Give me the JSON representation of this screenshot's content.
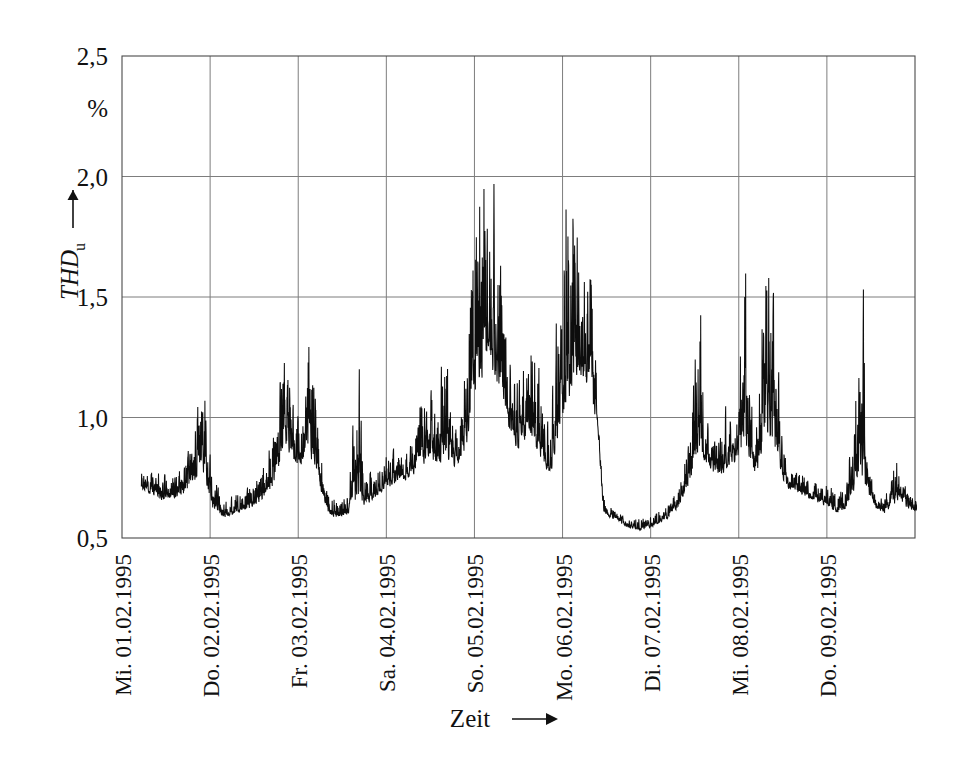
{
  "figure": {
    "background_color": "#ffffff",
    "ink_color": "#111111",
    "grid_color": "#7d7d7d"
  },
  "chart_data": {
    "type": "line",
    "title": "",
    "subtitle": "",
    "xlabel": "Zeit",
    "xlabel_arrow": "→",
    "ylabel": "THD",
    "ylabel_subscript": "u",
    "ylabel_arrow": "→",
    "yunit": "%",
    "ylim": [
      0.5,
      2.5
    ],
    "xlim": [
      0,
      9
    ],
    "grid": true,
    "legend": "none",
    "y_ticks": [
      0.5,
      1.0,
      1.5,
      2.0,
      2.5
    ],
    "y_tick_labels": [
      "0,5",
      "1,0",
      "1,5",
      "2,0",
      "2,5"
    ],
    "x_tick_positions": [
      0,
      1,
      2,
      3,
      4,
      5,
      6,
      7,
      8
    ],
    "x_tick_labels": [
      "Mi. 01.02.1995",
      "Do. 02.02.1995",
      "Fr. 03.02.1995",
      "Sa. 04.02.1995",
      "So. 05.02.1995",
      "Mo. 06.02.1995",
      "Di. 07.02.1995",
      "Mi. 08.02.1995",
      "Do. 09.02.1995"
    ],
    "x_tick_rotation_deg": -90,
    "series_name": "THD_u",
    "sampling_note": "10-minute aggregated values over 8 days",
    "data_start_x": 0.22,
    "data_end_x": 8.07,
    "observed_min": 0.53,
    "observed_max": 2.53,
    "envelope_keypoints": [
      {
        "x": 0.22,
        "base": 0.7,
        "peak": 0.8
      },
      {
        "x": 0.33,
        "base": 0.68,
        "peak": 0.82
      },
      {
        "x": 0.45,
        "base": 0.65,
        "peak": 0.79
      },
      {
        "x": 0.58,
        "base": 0.66,
        "peak": 0.8
      },
      {
        "x": 0.7,
        "base": 0.67,
        "peak": 0.83
      },
      {
        "x": 0.8,
        "base": 0.7,
        "peak": 0.95
      },
      {
        "x": 0.88,
        "base": 0.75,
        "peak": 1.27
      },
      {
        "x": 0.94,
        "base": 0.72,
        "peak": 1.24
      },
      {
        "x": 1.02,
        "base": 0.62,
        "peak": 0.8
      },
      {
        "x": 1.15,
        "base": 0.58,
        "peak": 0.68
      },
      {
        "x": 1.3,
        "base": 0.6,
        "peak": 0.7
      },
      {
        "x": 1.45,
        "base": 0.62,
        "peak": 0.74
      },
      {
        "x": 1.58,
        "base": 0.64,
        "peak": 0.8
      },
      {
        "x": 1.7,
        "base": 0.7,
        "peak": 0.98
      },
      {
        "x": 1.8,
        "base": 0.8,
        "peak": 1.3
      },
      {
        "x": 1.86,
        "base": 0.85,
        "peak": 1.66
      },
      {
        "x": 1.92,
        "base": 0.82,
        "peak": 1.2
      },
      {
        "x": 1.98,
        "base": 0.78,
        "peak": 1.0
      },
      {
        "x": 2.04,
        "base": 0.8,
        "peak": 1.1
      },
      {
        "x": 2.1,
        "base": 0.85,
        "peak": 1.55
      },
      {
        "x": 2.16,
        "base": 0.8,
        "peak": 1.47
      },
      {
        "x": 2.24,
        "base": 0.7,
        "peak": 0.95
      },
      {
        "x": 2.34,
        "base": 0.6,
        "peak": 0.72
      },
      {
        "x": 2.46,
        "base": 0.57,
        "peak": 0.66
      },
      {
        "x": 2.58,
        "base": 0.6,
        "peak": 0.7
      },
      {
        "x": 2.66,
        "base": 0.62,
        "peak": 1.63
      },
      {
        "x": 2.74,
        "base": 0.63,
        "peak": 0.8
      },
      {
        "x": 2.88,
        "base": 0.66,
        "peak": 0.82
      },
      {
        "x": 3.0,
        "base": 0.7,
        "peak": 0.88
      },
      {
        "x": 3.12,
        "base": 0.72,
        "peak": 0.92
      },
      {
        "x": 3.24,
        "base": 0.74,
        "peak": 0.9
      },
      {
        "x": 3.34,
        "base": 0.76,
        "peak": 1.02
      },
      {
        "x": 3.42,
        "base": 0.8,
        "peak": 1.28
      },
      {
        "x": 3.5,
        "base": 0.82,
        "peak": 1.24
      },
      {
        "x": 3.58,
        "base": 0.78,
        "peak": 1.0
      },
      {
        "x": 3.66,
        "base": 0.8,
        "peak": 1.57
      },
      {
        "x": 3.74,
        "base": 0.78,
        "peak": 1.05
      },
      {
        "x": 3.82,
        "base": 0.8,
        "peak": 1.02
      },
      {
        "x": 3.9,
        "base": 0.85,
        "peak": 1.35
      },
      {
        "x": 3.98,
        "base": 1.0,
        "peak": 1.9
      },
      {
        "x": 4.04,
        "base": 1.1,
        "peak": 2.53
      },
      {
        "x": 4.1,
        "base": 1.15,
        "peak": 2.22
      },
      {
        "x": 4.16,
        "base": 1.2,
        "peak": 1.85
      },
      {
        "x": 4.22,
        "base": 1.15,
        "peak": 2.08
      },
      {
        "x": 4.3,
        "base": 1.05,
        "peak": 1.8
      },
      {
        "x": 4.38,
        "base": 0.95,
        "peak": 1.45
      },
      {
        "x": 4.46,
        "base": 0.85,
        "peak": 1.22
      },
      {
        "x": 4.54,
        "base": 0.88,
        "peak": 1.28
      },
      {
        "x": 4.62,
        "base": 0.9,
        "peak": 1.48
      },
      {
        "x": 4.7,
        "base": 0.85,
        "peak": 1.38
      },
      {
        "x": 4.78,
        "base": 0.8,
        "peak": 1.1
      },
      {
        "x": 4.86,
        "base": 0.75,
        "peak": 1.05
      },
      {
        "x": 4.92,
        "base": 0.8,
        "peak": 1.45
      },
      {
        "x": 4.98,
        "base": 0.95,
        "peak": 1.62
      },
      {
        "x": 5.04,
        "base": 1.0,
        "peak": 2.49
      },
      {
        "x": 5.1,
        "base": 1.05,
        "peak": 2.22
      },
      {
        "x": 5.16,
        "base": 1.1,
        "peak": 1.9
      },
      {
        "x": 5.22,
        "base": 1.15,
        "peak": 1.88
      },
      {
        "x": 5.28,
        "base": 1.1,
        "peak": 1.78
      },
      {
        "x": 5.34,
        "base": 1.0,
        "peak": 1.8
      },
      {
        "x": 5.4,
        "base": 0.95,
        "peak": 1.02
      },
      {
        "x": 5.46,
        "base": 0.6,
        "peak": 0.7
      },
      {
        "x": 5.6,
        "base": 0.57,
        "peak": 0.62
      },
      {
        "x": 5.75,
        "base": 0.54,
        "peak": 0.6
      },
      {
        "x": 5.9,
        "base": 0.53,
        "peak": 0.6
      },
      {
        "x": 6.05,
        "base": 0.55,
        "peak": 0.62
      },
      {
        "x": 6.2,
        "base": 0.58,
        "peak": 0.66
      },
      {
        "x": 6.32,
        "base": 0.62,
        "peak": 0.74
      },
      {
        "x": 6.42,
        "base": 0.7,
        "peak": 0.95
      },
      {
        "x": 6.5,
        "base": 0.78,
        "peak": 1.3
      },
      {
        "x": 6.56,
        "base": 0.82,
        "peak": 1.75
      },
      {
        "x": 6.62,
        "base": 0.8,
        "peak": 1.05
      },
      {
        "x": 6.7,
        "base": 0.76,
        "peak": 0.92
      },
      {
        "x": 6.8,
        "base": 0.74,
        "peak": 0.98
      },
      {
        "x": 6.88,
        "base": 0.78,
        "peak": 1.12
      },
      {
        "x": 6.94,
        "base": 0.8,
        "peak": 1.05
      },
      {
        "x": 7.0,
        "base": 0.82,
        "peak": 1.15
      },
      {
        "x": 7.06,
        "base": 0.85,
        "peak": 1.97
      },
      {
        "x": 7.12,
        "base": 0.8,
        "peak": 1.3
      },
      {
        "x": 7.18,
        "base": 0.75,
        "peak": 0.95
      },
      {
        "x": 7.24,
        "base": 0.78,
        "peak": 1.35
      },
      {
        "x": 7.3,
        "base": 0.85,
        "peak": 1.97
      },
      {
        "x": 7.36,
        "base": 0.88,
        "peak": 1.62
      },
      {
        "x": 7.42,
        "base": 0.82,
        "peak": 1.63
      },
      {
        "x": 7.48,
        "base": 0.75,
        "peak": 1.05
      },
      {
        "x": 7.56,
        "base": 0.7,
        "peak": 0.82
      },
      {
        "x": 7.68,
        "base": 0.68,
        "peak": 0.8
      },
      {
        "x": 7.8,
        "base": 0.66,
        "peak": 0.78
      },
      {
        "x": 7.92,
        "base": 0.64,
        "peak": 0.76
      },
      {
        "x": 8.02,
        "base": 0.62,
        "peak": 0.74
      },
      {
        "x": 8.12,
        "base": 0.6,
        "peak": 0.7
      },
      {
        "x": 8.22,
        "base": 0.62,
        "peak": 0.72
      },
      {
        "x": 8.34,
        "base": 0.7,
        "peak": 1.32
      },
      {
        "x": 8.4,
        "base": 0.72,
        "peak": 1.9
      },
      {
        "x": 8.46,
        "base": 0.68,
        "peak": 0.9
      },
      {
        "x": 8.56,
        "base": 0.62,
        "peak": 0.72
      },
      {
        "x": 8.66,
        "base": 0.6,
        "peak": 0.68
      },
      {
        "x": 8.76,
        "base": 0.62,
        "peak": 0.88
      },
      {
        "x": 8.82,
        "base": 0.66,
        "peak": 0.85
      },
      {
        "x": 8.9,
        "base": 0.62,
        "peak": 0.72
      },
      {
        "x": 9.0,
        "base": 0.6,
        "peak": 0.7
      },
      {
        "x": 9.1,
        "base": 0.62,
        "peak": 0.72
      },
      {
        "x": 9.2,
        "base": 0.7,
        "peak": 1.1
      },
      {
        "x": 9.28,
        "base": 0.8,
        "peak": 1.2
      },
      {
        "x": 9.34,
        "base": 0.9,
        "peak": 1.05
      },
      {
        "x": 9.4,
        "base": 1.0,
        "peak": 1.42
      }
    ]
  },
  "geometry": {
    "plot_left": 122,
    "plot_right": 915,
    "plot_top": 56,
    "plot_bottom": 538
  }
}
